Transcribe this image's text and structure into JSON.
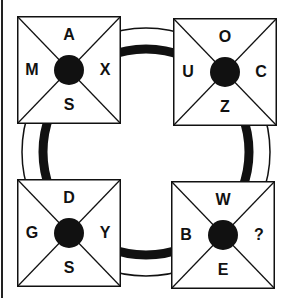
{
  "puzzle": {
    "boxes": [
      {
        "position": "top-left",
        "top": "A",
        "left": "M",
        "right": "X",
        "bottom": "S"
      },
      {
        "position": "top-right",
        "top": "O",
        "left": "U",
        "right": "C",
        "bottom": "Z"
      },
      {
        "position": "bottom-left",
        "top": "D",
        "left": "G",
        "right": "Y",
        "bottom": "S"
      },
      {
        "position": "bottom-right",
        "top": "W",
        "left": "B",
        "right": "?",
        "bottom": "E"
      }
    ],
    "colors": {
      "ink": "#111111",
      "background": "#ffffff"
    }
  }
}
